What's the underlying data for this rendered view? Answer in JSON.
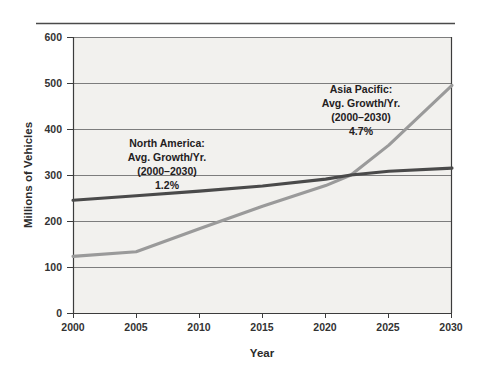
{
  "chart_data": {
    "type": "line",
    "title": "",
    "subtitle": "",
    "xlabel": "Year",
    "ylabel": "Millions of Vehicles",
    "xlim": [
      2000,
      2030
    ],
    "ylim": [
      0,
      600
    ],
    "grid": true,
    "legend_position": "inline-annotations",
    "x_ticks": [
      "2000",
      "2005",
      "2010",
      "2015",
      "2020",
      "2025",
      "2030"
    ],
    "y_ticks": [
      "0",
      "100",
      "200",
      "300",
      "400",
      "500",
      "600"
    ],
    "x": [
      2000,
      2005,
      2010,
      2015,
      2020,
      2022,
      2025,
      2030
    ],
    "series": [
      {
        "name": "North America",
        "color": "#4a4a4a",
        "values": [
          245,
          255,
          265,
          276,
          291,
          300,
          308,
          315
        ]
      },
      {
        "name": "Asia Pacific",
        "color": "#9a9a9a",
        "values": [
          123,
          133,
          183,
          232,
          277,
          300,
          365,
          495
        ]
      }
    ],
    "annotations": [
      {
        "id": "north-america",
        "lines": [
          "North America:",
          "Avg. Growth/Yr.",
          "(2000–2030)",
          "1.2%"
        ],
        "growth": "1.2%",
        "period": "(2000–2030)"
      },
      {
        "id": "asia-pacific",
        "lines": [
          "Asia Pacific:",
          "Avg. Growth/Yr.",
          "(2000–2030)",
          "4.7%"
        ],
        "growth": "4.7%",
        "period": "(2000–2030)"
      }
    ]
  },
  "axes": {
    "y_title": "Millions of Vehicles",
    "x_title": "Year",
    "y_tick_600": "600",
    "y_tick_500": "500",
    "y_tick_400": "400",
    "y_tick_300": "300",
    "y_tick_200": "200",
    "y_tick_100": "100",
    "y_tick_0": "0",
    "x_tick_2000": "2000",
    "x_tick_2005": "2005",
    "x_tick_2010": "2010",
    "x_tick_2015": "2015",
    "x_tick_2020": "2020",
    "x_tick_2025": "2025",
    "x_tick_2030": "2030"
  },
  "annotations": {
    "na_line1": "North America:",
    "na_line2": "Avg. Growth/Yr.",
    "na_line3": "(2000–2030)",
    "na_line4": "1.2%",
    "ap_line1": "Asia Pacific:",
    "ap_line2": "Avg. Growth/Yr.",
    "ap_line3": "(2000–2030)",
    "ap_line4": "4.7%"
  },
  "colors": {
    "north_america_line": "#4a4a4a",
    "asia_pacific_line": "#9a9a9a",
    "plot_background": "#f2f1ee",
    "gridline": "#808080",
    "axis": "#3c3c3c",
    "page_background": "#ffffff"
  }
}
